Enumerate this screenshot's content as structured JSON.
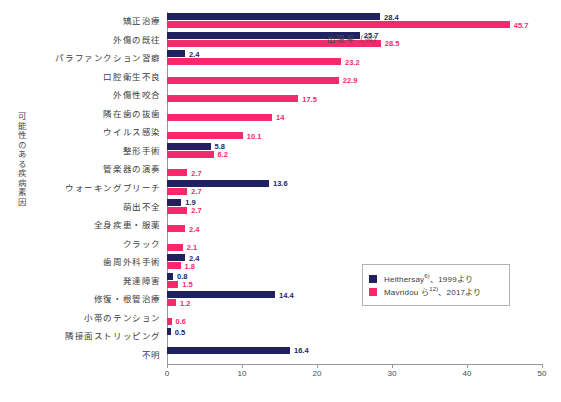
{
  "chart_data": {
    "type": "bar",
    "orientation": "horizontal",
    "title": "",
    "xlabel": "出現率（%）",
    "ylabel": "可能性のある疾病素因",
    "xlim": [
      0,
      50
    ],
    "xticks": [
      0,
      10,
      20,
      30,
      40,
      50
    ],
    "grid": false,
    "legend_position": "right-middle",
    "categories": [
      "矯正治療",
      "外傷の既往",
      "パラファンクション習癖",
      "口腔衛生不良",
      "外傷性咬合",
      "隣在歯の抜歯",
      "ウイルス感染",
      "整形手術",
      "管楽器の演奏",
      "ウォーキングブリーチ",
      "萌出不全",
      "全身疾患・服薬",
      "クラック",
      "歯周外科手術",
      "発達障害",
      "修復・根管治療",
      "小帯のテンション",
      "隣接面ストリッピング",
      "不明"
    ],
    "series": [
      {
        "name": "Heithersay",
        "color": "#1f2160",
        "values": [
          28.4,
          25.7,
          2.4,
          null,
          null,
          null,
          null,
          5.8,
          null,
          13.6,
          1.9,
          null,
          null,
          2.4,
          0.8,
          14.4,
          null,
          0.5,
          16.4
        ]
      },
      {
        "name": "Mavridou",
        "color": "#f5296b",
        "values": [
          45.7,
          28.5,
          23.2,
          22.9,
          17.5,
          14,
          10.1,
          6.2,
          2.7,
          2.7,
          2.7,
          2.4,
          2.1,
          1.8,
          1.5,
          1.2,
          0.6,
          null,
          null
        ]
      }
    ],
    "legend": [
      {
        "color": "#1f2160",
        "text_main": "Heithersay",
        "text_sup": "6)",
        "text_tail": "、1999より"
      },
      {
        "color": "#f5296b",
        "text_main": "Mavridou ら",
        "text_sup": "12)",
        "text_tail": "、2017より"
      }
    ]
  },
  "colors": {
    "navy": "#1f2160",
    "pink": "#f5296b",
    "axis": "#9a9a9a",
    "text": "#3c3c3c",
    "background": "#ffffff"
  }
}
